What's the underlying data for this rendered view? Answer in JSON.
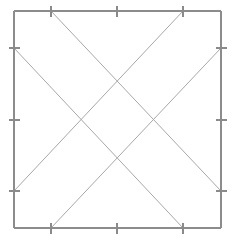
{
  "figure": {
    "type": "line-diagram",
    "background_color": "#ffffff",
    "canvas": {
      "width": 236,
      "height": 241
    },
    "frame": {
      "name": "outer-square",
      "color": "#8c8c8c",
      "stroke_width": 1.6,
      "left": 14,
      "top": 11,
      "right": 221,
      "bottom": 228,
      "width": 207,
      "height": 217
    },
    "ticks": {
      "color": "#8a8a8a",
      "stroke_width": 1.4,
      "length": 11,
      "count_per_edge": 3,
      "top": [
        {
          "label": "top-tick-1",
          "x": 51,
          "y": 11
        },
        {
          "label": "top-tick-2",
          "x": 117,
          "y": 11
        },
        {
          "label": "top-tick-3",
          "x": 183,
          "y": 11
        }
      ],
      "bottom": [
        {
          "label": "bottom-tick-1",
          "x": 51,
          "y": 228
        },
        {
          "label": "bottom-tick-2",
          "x": 117,
          "y": 228
        },
        {
          "label": "bottom-tick-3",
          "x": 183,
          "y": 228
        }
      ],
      "left": [
        {
          "label": "left-tick-1",
          "x": 14,
          "y": 48
        },
        {
          "label": "left-tick-2",
          "x": 14,
          "y": 120
        },
        {
          "label": "left-tick-3",
          "x": 14,
          "y": 191
        }
      ],
      "right": [
        {
          "label": "right-tick-1",
          "x": 221,
          "y": 48
        },
        {
          "label": "right-tick-2",
          "x": 221,
          "y": 120
        },
        {
          "label": "right-tick-3",
          "x": 221,
          "y": 191
        }
      ]
    },
    "diagonals": {
      "color": "#a8a8a8",
      "stroke_width": 1.0,
      "count": 4,
      "lines": [
        {
          "label": "diagonal-top-left-to-bottom-right",
          "x1": 51,
          "y1": 11,
          "x2": 221,
          "y2": 191
        },
        {
          "label": "diagonal-top-right-to-bottom-left",
          "x1": 183,
          "y1": 11,
          "x2": 14,
          "y2": 191
        },
        {
          "label": "diagonal-left-top-to-bottom-right",
          "x1": 14,
          "y1": 48,
          "x2": 183,
          "y2": 228
        },
        {
          "label": "diagonal-right-top-to-bottom-left",
          "x1": 221,
          "y1": 48,
          "x2": 51,
          "y2": 228
        }
      ]
    },
    "intersections": {
      "shape": "central-diamond",
      "points": [
        {
          "label": "intersection-top",
          "x": 117,
          "y": 82
        },
        {
          "label": "intersection-left",
          "x": 82,
          "y": 120
        },
        {
          "label": "intersection-right",
          "x": 153,
          "y": 120
        },
        {
          "label": "intersection-bottom",
          "x": 117,
          "y": 155
        }
      ]
    }
  }
}
